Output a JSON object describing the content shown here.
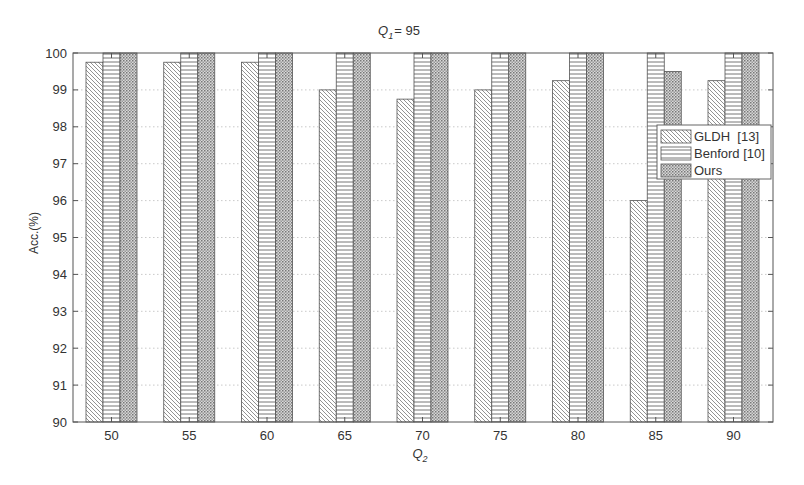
{
  "chart_data": {
    "type": "bar",
    "title_main": "Q",
    "title_sub": "1",
    "title_rest": "= 95",
    "xlabel": "Q2",
    "xlabel_main": "Q",
    "xlabel_sub": "2",
    "ylabel": "Acc.(%)",
    "ylim": [
      90,
      100
    ],
    "yticks": [
      90,
      91,
      92,
      93,
      94,
      95,
      96,
      97,
      98,
      99,
      100
    ],
    "grid": true,
    "legend_position": "right-inside",
    "categories": [
      "50",
      "55",
      "60",
      "65",
      "70",
      "75",
      "80",
      "85",
      "90"
    ],
    "series": [
      {
        "name": "GLDH  [13]",
        "pattern": "diagonal-hatch",
        "values": [
          99.75,
          99.75,
          99.75,
          99.0,
          98.75,
          99.0,
          99.25,
          96.0,
          99.25
        ]
      },
      {
        "name": "Benford [10]",
        "pattern": "horizontal-lines",
        "values": [
          100,
          100,
          100,
          100,
          100,
          100,
          100,
          100,
          100
        ]
      },
      {
        "name": "Ours",
        "pattern": "crosshatch-dots",
        "values": [
          100,
          100,
          100,
          100,
          100,
          100,
          100,
          99.5,
          100
        ]
      }
    ]
  },
  "colors": {
    "axis": "#555555",
    "grid": "#bbbbbb",
    "bar_stroke": "#555555",
    "text": "#333333"
  }
}
